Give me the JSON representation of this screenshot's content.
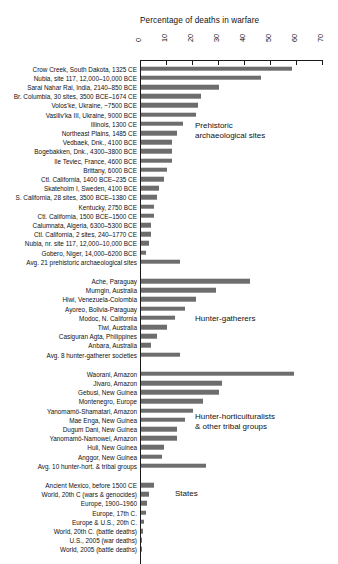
{
  "chart_data": {
    "type": "bar",
    "orientation": "horizontal",
    "title": "Percentage of deaths in warfare",
    "xlabel": "",
    "ylabel": "",
    "xlim": [
      0,
      70
    ],
    "xticks": [
      0,
      10,
      20,
      30,
      40,
      50,
      60,
      70
    ],
    "xtick_labels": [
      "0",
      "10",
      "20",
      "30",
      "40",
      "50",
      "60",
      "70"
    ],
    "grid": false,
    "legend": "none",
    "bar_color": "#6d6d6d",
    "groups": [
      {
        "name": "Prehistoric archaeological sites",
        "annotation": "Prehistoric\narchaeological sites",
        "categories": [
          "Crow Creek, South Dakota, 1325 CE",
          "Nubia, site 117, 12,000–10,000 BCE",
          "Sarai Nahar Rai, India, 2140–850 BCE",
          "Br. Columbia, 30 sites, 3500 BCE–1674 CE",
          "Volos'ke, Ukraine, ~7500 BCE",
          "Vasiliv'ka III, Ukraine, 9000 BCE",
          "Illinois, 1300 CE",
          "Northeast Plains, 1485 CE",
          "Vedbaek, Dnk., 4100 BCE",
          "Bogebakken, Dnk., 4300–3800 BCE",
          "Ile Teviec, France, 4600 BCE",
          "Brittany, 6000 BCE",
          "Ctl. California, 1400 BCE–235 CE",
          "Skateholm I, Sweden, 4100 BCE",
          "S. California, 28 sites, 3500 BCE–1380 CE",
          "Kentucky, 2750 BCE",
          "Ctl. California, 1500 BCE–1500 CE",
          "Calumnata, Algeria, 6300–5300 BCE",
          "Ctl. California, 2 sites, 240–1770 CE",
          "Nubia, nr. site 117, 12,000–10,000 BCE",
          "Gobero, Niger, 14,000–6200 BCE",
          "Avg. 21 prehistoric archaeological sites"
        ],
        "values": [
          58,
          46,
          30,
          23,
          22,
          21,
          16,
          14,
          12,
          12,
          12,
          10,
          9,
          7,
          6,
          5,
          5,
          4,
          4,
          3,
          2,
          15
        ]
      },
      {
        "name": "Hunter-gatherers",
        "annotation": "Hunter-gatherers",
        "categories": [
          "Ache, Paraguay",
          "Murngin, Australia",
          "Hiwi, Venezuela-Colombia",
          "Ayoreo, Bolivia-Paraguay",
          "Modoc, N. California",
          "Tiwi, Australia",
          "Casiguran Agta, Philippines",
          "Anbara, Australia",
          "Avg. 8 hunter-gatherer societies"
        ],
        "values": [
          42,
          29,
          21,
          17,
          13,
          10,
          6,
          4,
          15
        ]
      },
      {
        "name": "Hunter-horticulturalists & other tribal groups",
        "annotation": "Hunter-horticulturalists\n& other tribal groups",
        "categories": [
          "Waorani, Amazon",
          "Jivaro, Amazon",
          "Gebusi, New Guinea",
          "Montenegro, Europe",
          "Yanomamö-Shamatari, Amazon",
          "Mae Enga, New Guinea",
          "Dugum Dani, New Guinea",
          "Yanomamö-Namowei, Amazon",
          "Huli, New Guinea",
          "Anggor, New Guinea",
          "Avg. 10 hunter-hort. & tribal groups"
        ],
        "values": [
          59,
          31,
          30,
          24,
          20,
          17,
          14,
          14,
          9,
          8,
          25
        ]
      },
      {
        "name": "States",
        "annotation": "States",
        "categories": [
          "Ancient Mexico, before 1500 CE",
          "World, 20th C (wars & genocides)",
          "Europe, 1900–1960",
          "Europe, 17th C.",
          "Europe & U.S., 20th C.",
          "World, 20th C. (battle deaths)",
          "U.S., 2005 (war deaths)",
          "World, 2005 (battle deaths)"
        ],
        "values": [
          5.0,
          3.0,
          2.4,
          2.0,
          1.0,
          0.8,
          0.12,
          0.04
        ]
      }
    ]
  }
}
